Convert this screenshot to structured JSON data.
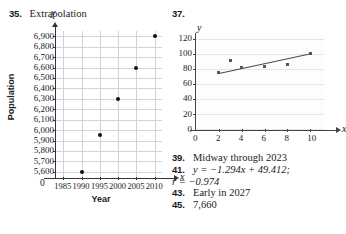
{
  "page": {
    "kind": "textbook-answer-key",
    "background_color": "#ffffff"
  },
  "problem35": {
    "number": "35.",
    "label": "Extrapolation"
  },
  "problem37": {
    "number": "37."
  },
  "answers": [
    {
      "number": "39.",
      "text": "Midway through 2023",
      "continuation": null
    },
    {
      "number": "41.",
      "text": "y = −1.294x + 49.412;",
      "continuation": "r = −0.974"
    },
    {
      "number": "43.",
      "text": "Early in 2027",
      "continuation": null
    },
    {
      "number": "45.",
      "text": "7,660",
      "continuation": null
    }
  ],
  "chart_data": [
    {
      "id": "chart35",
      "type": "scatter",
      "title": "",
      "xlabel": "Year",
      "ylabel": "Population",
      "x_axis_glyph": "x",
      "y_axis_glyph": "y",
      "origin_label": "0",
      "xlim": [
        1983,
        2012
      ],
      "ylim": [
        5550,
        6950
      ],
      "xticks": [
        1985,
        1990,
        1995,
        2000,
        2005,
        2010
      ],
      "xtick_labels": [
        "1985",
        "1990",
        "1995",
        "2000",
        "2005",
        "2010"
      ],
      "yticks": [
        5600,
        5700,
        5800,
        5900,
        6000,
        6100,
        6200,
        6300,
        6400,
        6500,
        6600,
        6700,
        6800,
        6900
      ],
      "ytick_labels": [
        "5,600",
        "5,700",
        "5,800",
        "5,900",
        "6,000",
        "6,100",
        "6,200",
        "6,300",
        "6,400",
        "6,500",
        "6,600",
        "6,700",
        "6,800",
        "6,900"
      ],
      "grid": true,
      "grid_color": "#cfd4dd",
      "point_color": "#111111",
      "points": [
        {
          "x": 1990,
          "y": 5600
        },
        {
          "x": 1995,
          "y": 5950
        },
        {
          "x": 2000,
          "y": 6300
        },
        {
          "x": 2005,
          "y": 6600
        },
        {
          "x": 2010,
          "y": 6900
        }
      ]
    },
    {
      "id": "chart37",
      "type": "scatter",
      "title": "",
      "xlabel": "",
      "ylabel": "",
      "x_axis_glyph": "x",
      "y_axis_glyph": "y",
      "origin_label": "0",
      "xlim": [
        0,
        11.2
      ],
      "ylim": [
        0,
        125
      ],
      "xticks": [
        0,
        2,
        4,
        6,
        8,
        10
      ],
      "xtick_labels": [
        "0",
        "2",
        "4",
        "6",
        "8",
        "10"
      ],
      "yticks": [
        0,
        20,
        40,
        60,
        80,
        100,
        120
      ],
      "ytick_labels": [
        "0",
        "20",
        "40",
        "60",
        "80",
        "100",
        "120"
      ],
      "grid": true,
      "grid_color": "#e2e6ec",
      "point_color": "#555555",
      "line_color": "#4a4a4a",
      "points": [
        {
          "x": 2,
          "y": 75
        },
        {
          "x": 3,
          "y": 91
        },
        {
          "x": 4,
          "y": 82
        },
        {
          "x": 6,
          "y": 83
        },
        {
          "x": 8,
          "y": 86
        },
        {
          "x": 10,
          "y": 101
        }
      ],
      "trend_line": {
        "from": {
          "x": 2,
          "y": 75
        },
        "to": {
          "x": 10,
          "y": 101
        }
      }
    }
  ]
}
